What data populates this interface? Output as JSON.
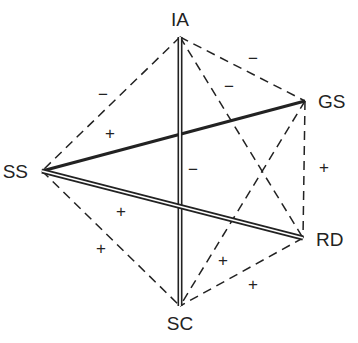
{
  "diagram": {
    "type": "signed-graph",
    "nodes": [
      {
        "id": "IA",
        "label": "IA"
      },
      {
        "id": "GS",
        "label": "GS"
      },
      {
        "id": "RD",
        "label": "RD"
      },
      {
        "id": "SC",
        "label": "SC"
      },
      {
        "id": "SS",
        "label": "SS"
      }
    ],
    "edges": [
      {
        "from": "IA",
        "to": "SC",
        "style": "double"
      },
      {
        "from": "SS",
        "to": "GS",
        "style": "thick"
      },
      {
        "from": "SS",
        "to": "RD",
        "style": "double"
      },
      {
        "from": "IA",
        "to": "SS",
        "style": "dashed"
      },
      {
        "from": "IA",
        "to": "GS",
        "style": "dashed"
      },
      {
        "from": "IA",
        "to": "RD",
        "style": "dashed"
      },
      {
        "from": "GS",
        "to": "RD",
        "style": "dashed"
      },
      {
        "from": "GS",
        "to": "SC",
        "style": "dashed"
      },
      {
        "from": "RD",
        "to": "SC",
        "style": "dashed"
      },
      {
        "from": "SS",
        "to": "SC",
        "style": "dashed"
      }
    ],
    "signs": [
      {
        "text": "−",
        "near": "IA-SS"
      },
      {
        "text": "+",
        "near": "SS-GS"
      },
      {
        "text": "−",
        "near": "IA-GS"
      },
      {
        "text": "−",
        "near": "IA-RD"
      },
      {
        "text": "−",
        "near": "IA-SC"
      },
      {
        "text": "+",
        "near": "SS-RD"
      },
      {
        "text": "+",
        "near": "SS-SC"
      },
      {
        "text": "+",
        "near": "GS-RD"
      },
      {
        "text": "+",
        "near": "GS-SC"
      },
      {
        "text": "+",
        "near": "RD-SC"
      }
    ],
    "colors": {
      "line": "#222222",
      "background": "#ffffff"
    }
  }
}
